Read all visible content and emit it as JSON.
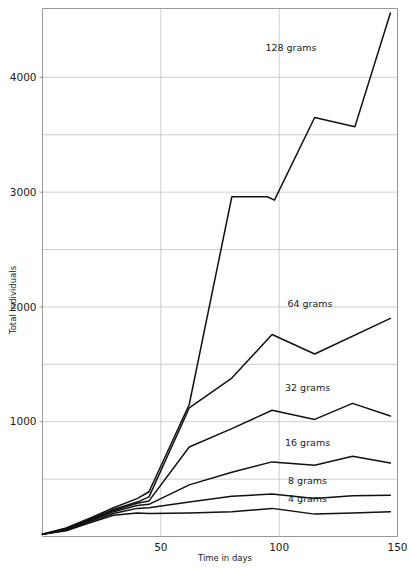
{
  "chart_data": {
    "type": "line",
    "title": "",
    "xlabel": "Time in days",
    "ylabel": "Total individuals",
    "xlim": [
      0,
      150
    ],
    "ylim": [
      0,
      4600
    ],
    "grid": true,
    "legend_position": "inline-right",
    "x_ticks": [
      50,
      100,
      150
    ],
    "x_tick_labels": [
      "50",
      "100",
      "150"
    ],
    "x_gridlines": [
      50,
      100,
      150
    ],
    "y_ticks": [
      1000,
      2000,
      3000,
      4000
    ],
    "y_tick_labels": [
      "1000",
      "2000",
      "3000",
      "4000"
    ],
    "y_gridlines": [
      500,
      1000,
      1500,
      2000,
      2500,
      3000,
      3500,
      4000
    ],
    "series": [
      {
        "name": "128 grams",
        "label": "128 grams",
        "label_x": 105,
        "label_y": 4230,
        "x": [
          0,
          10,
          20,
          30,
          40,
          45,
          62,
          80,
          95,
          98,
          115,
          132,
          147
        ],
        "values": [
          20,
          75,
          160,
          250,
          330,
          390,
          1150,
          2960,
          2960,
          2930,
          3650,
          3570,
          4560
        ]
      },
      {
        "name": "64 grams",
        "label": "64 grams",
        "label_x": 113,
        "label_y": 2000,
        "x": [
          0,
          10,
          20,
          30,
          40,
          45,
          62,
          80,
          97,
          115,
          147
        ],
        "values": [
          20,
          70,
          150,
          235,
          300,
          345,
          1120,
          1380,
          1760,
          1590,
          1900
        ]
      },
      {
        "name": "32 grams",
        "label": "32 grams",
        "label_x": 112,
        "label_y": 1270,
        "x": [
          0,
          10,
          20,
          30,
          40,
          45,
          62,
          80,
          97,
          115,
          131,
          147
        ],
        "values": [
          20,
          65,
          145,
          225,
          290,
          310,
          780,
          940,
          1100,
          1020,
          1160,
          1050
        ]
      },
      {
        "name": "16 grams",
        "label": "16 grams",
        "label_x": 112,
        "label_y": 790,
        "x": [
          0,
          10,
          20,
          30,
          40,
          45,
          62,
          80,
          97,
          115,
          131,
          147
        ],
        "values": [
          20,
          60,
          140,
          215,
          270,
          280,
          450,
          560,
          650,
          620,
          700,
          640
        ]
      },
      {
        "name": "8 grams",
        "label": "8 grams",
        "label_x": 112,
        "label_y": 460,
        "x": [
          0,
          10,
          20,
          30,
          40,
          45,
          62,
          80,
          97,
          115,
          131,
          147
        ],
        "values": [
          20,
          55,
          130,
          200,
          245,
          250,
          300,
          350,
          370,
          330,
          355,
          360
        ]
      },
      {
        "name": "4 grams",
        "label": "4 grams",
        "label_x": 112,
        "label_y": 300,
        "x": [
          0,
          10,
          20,
          30,
          40,
          45,
          62,
          80,
          97,
          115,
          131,
          147
        ],
        "values": [
          20,
          50,
          120,
          185,
          205,
          200,
          205,
          215,
          245,
          195,
          205,
          215
        ]
      }
    ]
  },
  "axes": {
    "x_title": "Time in days",
    "y_title": "Total individuals"
  },
  "colors": {
    "line": "#111111",
    "grid": "#b9b9b9",
    "frame": "#8d8d8d",
    "text": "#1a1a1a",
    "background": "#ffffff"
  }
}
